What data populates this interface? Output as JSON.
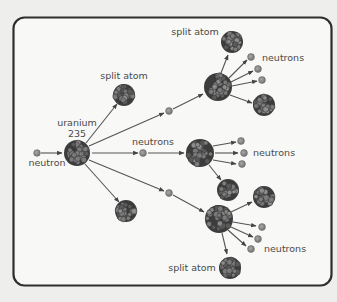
{
  "diagram": {
    "colors": {
      "background": "#eeeeec",
      "panel": "#f8f8f6",
      "border": "#2e2e2e",
      "neutron": "#8a8a8a",
      "nucleus_dark": "#4a4a4a",
      "nucleus_light": "#7a7a7a",
      "text": "#4a4a4a",
      "arrow": "#555555"
    },
    "labels": {
      "incoming_neutron": "neutron",
      "uranium_line1": "uranium",
      "uranium_line2": "235",
      "split_atom_upper_left": "split atom",
      "neutrons_center": "neutrons",
      "split_atom_top_right": "split atom",
      "neutrons_top_right": "neutrons",
      "neutrons_middle_right": "neutrons",
      "neutrons_bottom_right": "neutrons",
      "split_atom_bottom": "split atom"
    },
    "nodes": [
      {
        "id": "incoming-neutron",
        "type": "neutron",
        "x": 37,
        "y": 153
      },
      {
        "id": "uranium-235",
        "type": "nucleus",
        "x": 77,
        "y": 153,
        "r": 13
      },
      {
        "id": "split-atom-1a",
        "type": "split",
        "x": 124,
        "y": 95,
        "r": 11
      },
      {
        "id": "split-atom-1b",
        "type": "split",
        "x": 126,
        "y": 211,
        "r": 11
      },
      {
        "id": "neutron-1a",
        "type": "neutron",
        "x": 169,
        "y": 111
      },
      {
        "id": "neutron-1b",
        "type": "neutron",
        "x": 143,
        "y": 153
      },
      {
        "id": "neutron-1c",
        "type": "neutron",
        "x": 169,
        "y": 193
      },
      {
        "id": "nucleus-top",
        "type": "nucleus",
        "x": 218,
        "y": 87,
        "r": 14
      },
      {
        "id": "nucleus-mid",
        "type": "nucleus",
        "x": 200,
        "y": 153,
        "r": 14
      },
      {
        "id": "nucleus-bottom",
        "type": "nucleus",
        "x": 219,
        "y": 219,
        "r": 14
      }
    ]
  }
}
